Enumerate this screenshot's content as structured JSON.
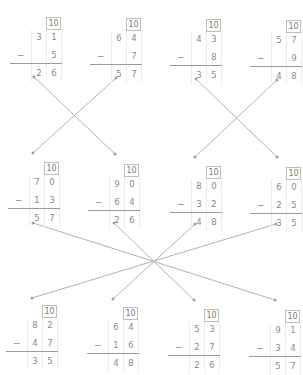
{
  "header": {
    "fragment": ""
  },
  "borrow_label": "10",
  "operator": "−",
  "rows": [
    {
      "problems": [
        {
          "top": [
            "3",
            "1"
          ],
          "bottom": [
            "",
            "5"
          ],
          "result": [
            "2",
            "6"
          ]
        },
        {
          "top": [
            "6",
            "4"
          ],
          "bottom": [
            "",
            "7"
          ],
          "result": [
            "5",
            "7"
          ]
        },
        {
          "top": [
            "4",
            "3"
          ],
          "bottom": [
            "",
            "8"
          ],
          "result": [
            "3",
            "5"
          ]
        },
        {
          "top": [
            "5",
            "7"
          ],
          "bottom": [
            "",
            "9"
          ],
          "result": [
            "4",
            "8"
          ]
        }
      ]
    },
    {
      "problems": [
        {
          "top": [
            "7",
            "0"
          ],
          "bottom": [
            "1",
            "3"
          ],
          "result": [
            "5",
            "7"
          ]
        },
        {
          "top": [
            "9",
            "0"
          ],
          "bottom": [
            "6",
            "4"
          ],
          "result": [
            "2",
            "6"
          ]
        },
        {
          "top": [
            "8",
            "0"
          ],
          "bottom": [
            "3",
            "2"
          ],
          "result": [
            "4",
            "8"
          ]
        },
        {
          "top": [
            "6",
            "0"
          ],
          "bottom": [
            "2",
            "5"
          ],
          "result": [
            "3",
            "5"
          ]
        }
      ]
    },
    {
      "problems": [
        {
          "top": [
            "8",
            "2"
          ],
          "bottom": [
            "4",
            "7"
          ],
          "result": [
            "3",
            "5"
          ]
        },
        {
          "top": [
            "6",
            "4"
          ],
          "bottom": [
            "1",
            "6"
          ],
          "result": [
            "4",
            "8"
          ]
        },
        {
          "top": [
            "5",
            "3"
          ],
          "bottom": [
            "2",
            "7"
          ],
          "result": [
            "2",
            "6"
          ]
        },
        {
          "top": [
            "9",
            "1"
          ],
          "bottom": [
            "3",
            "4"
          ],
          "result": [
            "5",
            "7"
          ]
        }
      ]
    }
  ],
  "matching_lines": [
    {
      "from": "row1-p1",
      "to": "row2-p2"
    },
    {
      "from": "row1-p2",
      "to": "row2-p1"
    },
    {
      "from": "row1-p3",
      "to": "row2-p4"
    },
    {
      "from": "row1-p4",
      "to": "row2-p3"
    },
    {
      "from": "row2-p1",
      "to": "row3-p4"
    },
    {
      "from": "row2-p2",
      "to": "row3-p3"
    },
    {
      "from": "row2-p3",
      "to": "row3-p2"
    },
    {
      "from": "row2-p4",
      "to": "row3-p1"
    }
  ],
  "colors": {
    "line": "#b3b3b3",
    "text": "#8a8a8a",
    "box_border": "#bdbdbd"
  }
}
